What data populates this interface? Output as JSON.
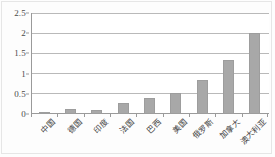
{
  "chart_data": {
    "type": "bar",
    "title": "",
    "subtitle": "",
    "xlabel": "",
    "ylabel": "",
    "categories": [
      "中国",
      "德国",
      "印度",
      "法国",
      "巴西",
      "美国",
      "俄罗斯",
      "加拿大",
      "澳大利亚"
    ],
    "values": [
      0.06,
      0.13,
      0.11,
      0.28,
      0.4,
      0.51,
      0.85,
      1.33,
      2.0
    ],
    "series": [
      {
        "name": "",
        "values": [
          0.06,
          0.13,
          0.11,
          0.28,
          0.4,
          0.51,
          0.85,
          1.33,
          2.0
        ]
      }
    ],
    "ylim": [
      0,
      2.5
    ],
    "ytick_labels": [
      "0",
      "0.5",
      "1",
      "1.5",
      "2",
      "2.5"
    ],
    "ytick_values": [
      0,
      0.5,
      1,
      1.5,
      2,
      2.5
    ],
    "grid": true,
    "grid_orientation": "horizontal",
    "legend": false,
    "legend_position": "none",
    "bar_color": "#a8a8a8",
    "bar_border_color": "#9d9d9d",
    "axis_color": "#9a9a9a",
    "gridline_color": "#b9b9b9",
    "plot_background": "#ffffff",
    "figure_background": "#fdfdfd",
    "xtick_label_rotation": -45,
    "annotations": []
  }
}
